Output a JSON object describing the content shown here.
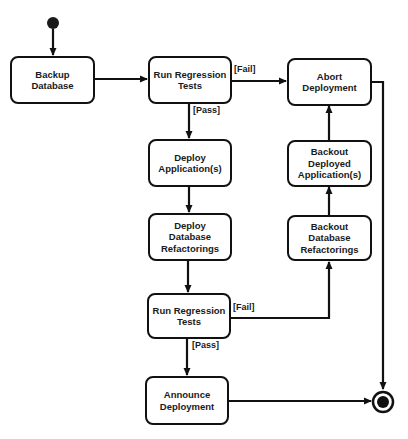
{
  "diagram": {
    "type": "UML activity diagram",
    "colors": {
      "stroke": "#111111",
      "background": "#ffffff",
      "text": "#1a1a1a"
    },
    "nodes": {
      "backup_database": "Backup\nDatabase",
      "run_tests_1": "Run Regression\nTests",
      "abort_deployment": "Abort\nDeployment",
      "deploy_apps": "Deploy\nApplication(s)",
      "deploy_db_refactorings": "Deploy\nDatabase\nRefactorings",
      "backout_apps": "Backout\nDeployed\nApplication(s)",
      "backout_db_refactorings": "Backout\nDatabase\nRefactorings",
      "run_tests_2": "Run Regression\nTests",
      "announce_deployment": "Announce\nDeployment"
    },
    "guards": {
      "fail_1": "[Fail]",
      "pass_1": "[Pass]",
      "fail_2": "[Fail]",
      "pass_2": "[Pass]"
    },
    "start_node": "initial-state",
    "end_node": "final-state"
  }
}
